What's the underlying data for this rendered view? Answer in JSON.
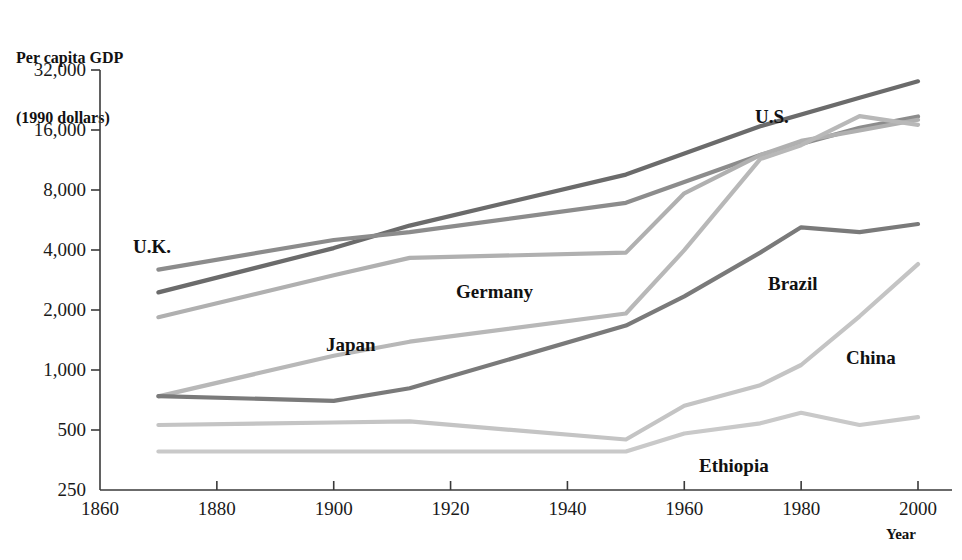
{
  "chart_data": {
    "type": "line",
    "title": "",
    "ylabel": "Per capita GDP\n(1990 dollars)",
    "ylabel_line1": "Per capita GDP",
    "ylabel_line2": "(1990 dollars)",
    "xlabel": "Year",
    "yscale": "log",
    "ylim": [
      250,
      32000
    ],
    "xlim": [
      1860,
      2000
    ],
    "grid": false,
    "legend": "inline-labels",
    "ytick_labels": [
      "32,000",
      "16,000",
      "8,000",
      "4,000",
      "2,000",
      "1,000",
      "500",
      "250"
    ],
    "ytick_values": [
      32000,
      16000,
      8000,
      4000,
      2000,
      1000,
      500,
      250
    ],
    "xtick_labels": [
      "1860",
      "1880",
      "1900",
      "1920",
      "1940",
      "1960",
      "1980",
      "2000"
    ],
    "xtick_values": [
      1860,
      1880,
      1900,
      1920,
      1940,
      1960,
      1980,
      2000
    ],
    "x": [
      1870,
      1900,
      1913,
      1950,
      1960,
      1973,
      1980,
      1990,
      2000
    ],
    "series": [
      {
        "name": "U.S.",
        "label": "U.S.",
        "color": "#6b6b6b",
        "label_x": 755,
        "label_y": 106,
        "x": [
          1870,
          1900,
          1913,
          1950,
          1973,
          1990,
          2000
        ],
        "values": [
          2450,
          4090,
          5300,
          9560,
          16690,
          23200,
          28100
        ]
      },
      {
        "name": "U.K.",
        "label": "U.K.",
        "color": "#8c8c8c",
        "label_x": 133,
        "label_y": 236,
        "x": [
          1870,
          1900,
          1913,
          1950,
          1973,
          1990,
          2000
        ],
        "values": [
          3190,
          4490,
          4920,
          6900,
          11990,
          16400,
          18700
        ]
      },
      {
        "name": "Germany",
        "label": "Germany",
        "color": "#b0b0b0",
        "label_x": 456,
        "label_y": 281,
        "x": [
          1870,
          1900,
          1913,
          1950,
          1960,
          1973,
          1980,
          1990,
          2000
        ],
        "values": [
          1840,
          2990,
          3650,
          3880,
          7700,
          11970,
          14100,
          15900,
          18000
        ]
      },
      {
        "name": "Japan",
        "label": "Japan",
        "color": "#b8b8b8",
        "label_x": 326,
        "label_y": 334,
        "x": [
          1870,
          1900,
          1913,
          1950,
          1960,
          1973,
          1980,
          1990,
          2000
        ],
        "values": [
          737,
          1180,
          1387,
          1920,
          3990,
          11430,
          13430,
          18790,
          17000
        ]
      },
      {
        "name": "Brazil",
        "label": "Brazil",
        "color": "#7a7a7a",
        "label_x": 768,
        "label_y": 273,
        "x": [
          1870,
          1900,
          1913,
          1950,
          1960,
          1973,
          1980,
          1990,
          2000
        ],
        "values": [
          740,
          700,
          810,
          1670,
          2340,
          3880,
          5200,
          4920,
          5400
        ]
      },
      {
        "name": "China",
        "label": "China",
        "color": "#c4c4c4",
        "label_x": 846,
        "label_y": 347,
        "x": [
          1870,
          1900,
          1913,
          1950,
          1960,
          1973,
          1980,
          1990,
          2000
        ],
        "values": [
          530,
          545,
          552,
          448,
          662,
          839,
          1060,
          1860,
          3400
        ]
      },
      {
        "name": "Ethiopia",
        "label": "Ethiopia",
        "color": "#c9c9c9",
        "label_x": 699,
        "label_y": 455,
        "x": [
          1870,
          1900,
          1913,
          1950,
          1960,
          1973,
          1980,
          1990,
          2000
        ],
        "values": [
          390,
          390,
          390,
          390,
          480,
          540,
          610,
          530,
          580
        ]
      }
    ]
  }
}
